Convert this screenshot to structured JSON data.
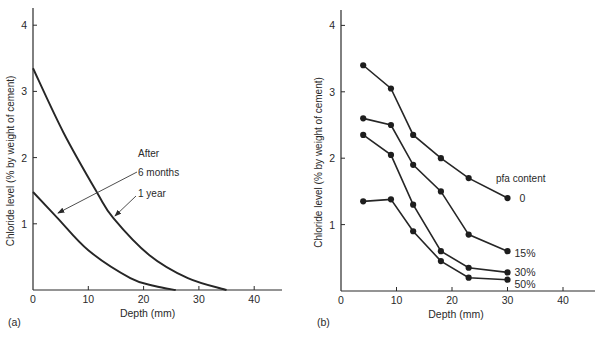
{
  "figure": {
    "panels": [
      "(a)",
      "(b)"
    ]
  },
  "chart_data": [
    {
      "panel_label": "(a)",
      "type": "line",
      "title": "",
      "xlabel": "Depth (mm)",
      "ylabel": "Chloride level (% by weight of cement)",
      "xlim": [
        0,
        45
      ],
      "ylim": [
        0,
        4.3
      ],
      "xticks": [
        0,
        10,
        20,
        30,
        40
      ],
      "yticks": [
        1,
        2,
        3,
        4
      ],
      "grid": false,
      "annotations": [
        {
          "text": "After",
          "role": "header"
        },
        {
          "text": "6 months",
          "points_to": "6 months"
        },
        {
          "text": "1 year",
          "points_to": "1 year"
        }
      ],
      "series": [
        {
          "name": "1 year",
          "x": [
            0,
            5.5,
            11.6,
            14.5,
            21,
            28,
            35
          ],
          "y": [
            3.35,
            2.38,
            1.47,
            1.09,
            0.53,
            0.18,
            0.0
          ]
        },
        {
          "name": "6 months",
          "x": [
            0,
            4.4,
            10,
            17.6,
            22,
            25.8
          ],
          "y": [
            1.48,
            1.09,
            0.6,
            0.18,
            0.06,
            0.0
          ]
        }
      ]
    },
    {
      "panel_label": "(b)",
      "type": "line",
      "title": "",
      "xlabel": "Depth (mm)",
      "ylabel": "Chloride level (% by weight of cement)",
      "xlim": [
        0,
        45
      ],
      "ylim": [
        0,
        4.3
      ],
      "xticks": [
        0,
        10,
        20,
        30,
        40
      ],
      "yticks": [
        1,
        2,
        3,
        4
      ],
      "grid": false,
      "legend_title": "pfa content",
      "x": [
        4,
        9,
        13,
        18,
        23,
        30
      ],
      "series": [
        {
          "name": "0",
          "values": [
            3.4,
            3.05,
            2.35,
            2.0,
            1.7,
            1.4
          ]
        },
        {
          "name": "15%",
          "values": [
            2.6,
            2.5,
            1.9,
            1.5,
            0.85,
            0.6
          ]
        },
        {
          "name": "30%",
          "values": [
            2.35,
            2.05,
            1.3,
            0.6,
            0.35,
            0.28
          ]
        },
        {
          "name": "50%",
          "values": [
            1.35,
            1.38,
            0.9,
            0.45,
            0.2,
            0.17
          ]
        }
      ]
    }
  ]
}
